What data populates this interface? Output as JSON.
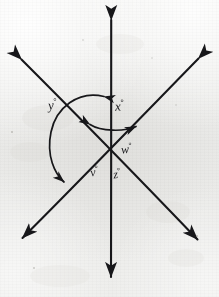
{
  "figure": {
    "kind": "hand-drawn-geometry-diagram",
    "medium": "pencil on light grey paper",
    "background_color": "#ececeb",
    "ink_color": "#17171a"
  },
  "canvas": {
    "width": 219,
    "height": 297
  },
  "intersection": {
    "x": 110,
    "y": 148,
    "label": "common-vertex"
  },
  "lines": [
    {
      "name": "vertical-line",
      "orientation": "vertical",
      "from": {
        "x": 111,
        "y": 14
      },
      "to": {
        "x": 111,
        "y": 283
      },
      "arrowheads": "both"
    },
    {
      "name": "nw-se-diagonal-line",
      "orientation": "northwest-to-southeast",
      "from": {
        "x": 16,
        "y": 54
      },
      "to": {
        "x": 203,
        "y": 245
      },
      "arrowheads": "both"
    },
    {
      "name": "ne-sw-diagonal-line",
      "orientation": "northeast-to-southwest",
      "from": {
        "x": 204,
        "y": 53
      },
      "to": {
        "x": 17,
        "y": 243
      },
      "arrowheads": "both"
    }
  ],
  "angle_labels": [
    {
      "name": "angle-y",
      "variable": "y",
      "unit_symbol": "°",
      "text": "y",
      "x": 52,
      "y": 106,
      "font_size": 12
    },
    {
      "name": "angle-x",
      "variable": "x",
      "unit_symbol": "°",
      "text": "x",
      "x": 118,
      "y": 106,
      "font_size": 12
    },
    {
      "name": "angle-w",
      "variable": "w",
      "unit_symbol": "°",
      "text": "w",
      "x": 124,
      "y": 148,
      "font_size": 12
    },
    {
      "name": "angle-v",
      "variable": "v",
      "unit_symbol": "°",
      "text": "v",
      "x": 93,
      "y": 171,
      "font_size": 12
    },
    {
      "name": "angle-z",
      "variable": "z",
      "unit_symbol": "°",
      "text": "z",
      "x": 116,
      "y": 173,
      "font_size": 12
    }
  ],
  "arcs": [
    {
      "name": "arc-x-small",
      "measures_angle": "x",
      "arrowheads": "both",
      "from": {
        "x": 84,
        "y": 124
      },
      "to": {
        "x": 142,
        "y": 127
      },
      "note": "small double-headed arc between the upward vertical ray and the northeast diagonal ray"
    },
    {
      "name": "arc-y-large",
      "measures_angle": "y",
      "arrowheads": "both",
      "from": {
        "x": 110,
        "y": 95
      },
      "to": {
        "x": 68,
        "y": 186
      },
      "note": "large double-headed arc sweeping counter-clockwise from the upward vertical ray round the left to the southwest diagonal ray"
    }
  ],
  "specks": [
    {
      "x": 12,
      "y": 132,
      "r": 1.0
    },
    {
      "x": 197,
      "y": 236,
      "r": 1.1
    },
    {
      "x": 83,
      "y": 40,
      "r": 0.8
    },
    {
      "x": 152,
      "y": 58,
      "r": 0.7
    },
    {
      "x": 34,
      "y": 268,
      "r": 0.9
    },
    {
      "x": 176,
      "y": 105,
      "r": 0.7
    }
  ]
}
